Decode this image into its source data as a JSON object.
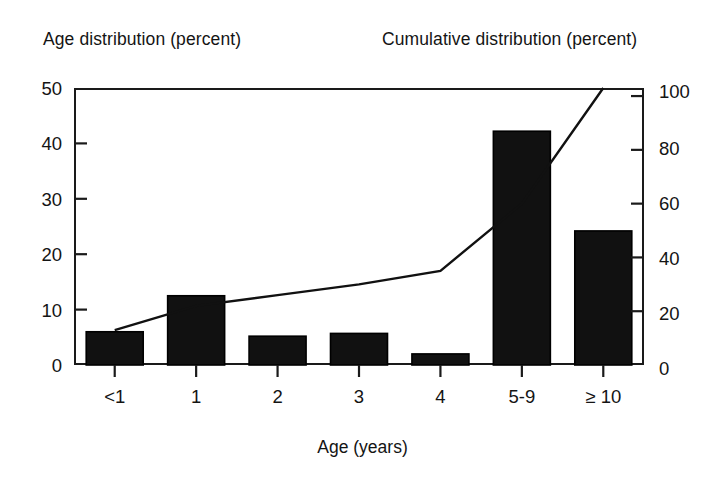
{
  "figure": {
    "left_axis_title": "Age distribution (percent)",
    "right_axis_title": "Cumulative distribution (percent)",
    "x_axis_title": "Age (years)"
  },
  "colors": {
    "bar_fill": "#111111",
    "bar_stroke": "#000000",
    "line": "#111111",
    "axis": "#1a1a1a",
    "background": "#ffffff",
    "text": "#141414"
  },
  "chart_data": {
    "type": "bar",
    "title": "",
    "subtitle": "",
    "xlabel": "Age (years)",
    "ylabel": "Age distribution (percent)",
    "y2label": "Cumulative distribution (percent)",
    "categories": [
      "<1",
      "1",
      "2",
      "3",
      "4",
      "5-9",
      "≥ 10"
    ],
    "ylim": [
      0,
      50
    ],
    "y2lim": [
      0,
      103
    ],
    "yticks": [
      0,
      10,
      20,
      30,
      40,
      50
    ],
    "y2ticks": [
      0,
      20,
      40,
      60,
      80,
      100
    ],
    "grid": false,
    "legend": "none",
    "series": [
      {
        "name": "Age distribution (percent)",
        "type": "bar",
        "axis": "left",
        "values": [
          6,
          12.5,
          5.2,
          5.7,
          2,
          42.2,
          24.2
        ]
      },
      {
        "name": "Cumulative distribution (percent)",
        "type": "line",
        "axis": "right",
        "values": [
          13,
          22,
          26,
          30,
          35,
          60,
          103
        ]
      }
    ]
  },
  "ticks": {
    "left": [
      "50",
      "40",
      "30",
      "20",
      "10",
      "0"
    ],
    "right": [
      "100",
      "80",
      "60",
      "40",
      "20",
      "0"
    ],
    "x": [
      "<1",
      "1",
      "2",
      "3",
      "4",
      "5-9",
      "≥ 10"
    ]
  }
}
